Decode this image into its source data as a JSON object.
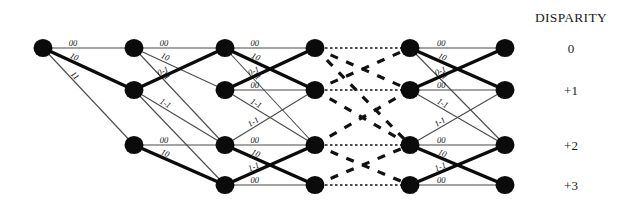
{
  "figure": {
    "title_right": "DISPARITY",
    "background_color": "#ffffff",
    "node_color": "#0b0b0b",
    "edge_color": "#4a4a4a",
    "bold_edge_color": "#0b0b0b",
    "dashed_edge_color": "#111111",
    "width": 624,
    "height": 216
  },
  "disparity_axis": {
    "title": "DISPARITY",
    "labels": [
      {
        "text": "0",
        "row": 0
      },
      {
        "text": "+1",
        "row": 1
      },
      {
        "text": "+2",
        "row": 2
      },
      {
        "text": "+3",
        "row": 3
      }
    ]
  },
  "chart_data": {
    "type": "diagram",
    "columns": [
      {
        "index": 0,
        "x": 43,
        "rows": [
          0
        ]
      },
      {
        "index": 1,
        "x": 134,
        "rows": [
          0,
          1,
          2
        ]
      },
      {
        "index": 2,
        "x": 225,
        "rows": [
          0,
          1,
          2,
          3
        ]
      },
      {
        "index": 3,
        "x": 315,
        "rows": [
          0,
          1,
          2,
          3
        ]
      },
      {
        "index": 4,
        "x": 410,
        "rows": [
          0,
          1,
          2,
          3
        ]
      },
      {
        "index": 5,
        "x": 505,
        "rows": [
          0,
          1,
          2,
          3
        ]
      }
    ],
    "row_y": [
      48,
      90,
      145,
      185
    ],
    "node_radius": 9.5,
    "edges": [
      {
        "from": [
          0,
          0
        ],
        "to": [
          1,
          0
        ],
        "style": "thin",
        "label": "00"
      },
      {
        "from": [
          0,
          0
        ],
        "to": [
          1,
          1
        ],
        "style": "bold",
        "label": "10"
      },
      {
        "from": [
          0,
          0
        ],
        "to": [
          1,
          2
        ],
        "style": "thin",
        "label": "11"
      },
      {
        "from": [
          1,
          0
        ],
        "to": [
          2,
          0
        ],
        "style": "thin",
        "label": "00"
      },
      {
        "from": [
          1,
          0
        ],
        "to": [
          2,
          1
        ],
        "style": "thin",
        "label": "10"
      },
      {
        "from": [
          1,
          0
        ],
        "to": [
          2,
          2
        ],
        "style": "thin",
        "label": "11"
      },
      {
        "from": [
          1,
          1
        ],
        "to": [
          2,
          0
        ],
        "style": "bold",
        "label": "0-1"
      },
      {
        "from": [
          1,
          1
        ],
        "to": [
          2,
          2
        ],
        "style": "thin",
        "label": "1-1"
      },
      {
        "from": [
          1,
          1
        ],
        "to": [
          2,
          3
        ],
        "style": "thin",
        "label": ""
      },
      {
        "from": [
          1,
          2
        ],
        "to": [
          2,
          2
        ],
        "style": "thin",
        "label": "00"
      },
      {
        "from": [
          1,
          2
        ],
        "to": [
          2,
          3
        ],
        "style": "bold",
        "label": "10"
      },
      {
        "from": [
          2,
          0
        ],
        "to": [
          3,
          0
        ],
        "style": "thin",
        "label": "00"
      },
      {
        "from": [
          2,
          0
        ],
        "to": [
          3,
          1
        ],
        "style": "bold",
        "label": "10"
      },
      {
        "from": [
          2,
          0
        ],
        "to": [
          3,
          2
        ],
        "style": "thin",
        "label": "11"
      },
      {
        "from": [
          2,
          1
        ],
        "to": [
          3,
          0
        ],
        "style": "bold",
        "label": "0-1"
      },
      {
        "from": [
          2,
          1
        ],
        "to": [
          3,
          1
        ],
        "style": "thin",
        "label": "00"
      },
      {
        "from": [
          2,
          1
        ],
        "to": [
          3,
          2
        ],
        "style": "thin",
        "label": "1-1"
      },
      {
        "from": [
          2,
          2
        ],
        "to": [
          3,
          1
        ],
        "style": "thin",
        "label": "1-1"
      },
      {
        "from": [
          2,
          2
        ],
        "to": [
          3,
          2
        ],
        "style": "thin",
        "label": "00"
      },
      {
        "from": [
          2,
          2
        ],
        "to": [
          3,
          3
        ],
        "style": "bold",
        "label": "10"
      },
      {
        "from": [
          2,
          3
        ],
        "to": [
          3,
          2
        ],
        "style": "bold",
        "label": "1-1"
      },
      {
        "from": [
          2,
          3
        ],
        "to": [
          3,
          3
        ],
        "style": "thin",
        "label": "00"
      },
      {
        "from": [
          3,
          0
        ],
        "to": [
          4,
          0
        ],
        "style": "dotted",
        "label": ""
      },
      {
        "from": [
          3,
          0
        ],
        "to": [
          4,
          1
        ],
        "style": "dashed",
        "label": ""
      },
      {
        "from": [
          3,
          0
        ],
        "to": [
          4,
          2
        ],
        "style": "dashed",
        "label": ""
      },
      {
        "from": [
          3,
          1
        ],
        "to": [
          4,
          0
        ],
        "style": "dashed",
        "label": ""
      },
      {
        "from": [
          3,
          1
        ],
        "to": [
          4,
          1
        ],
        "style": "dotted",
        "label": ""
      },
      {
        "from": [
          3,
          1
        ],
        "to": [
          4,
          2
        ],
        "style": "dashed",
        "label": ""
      },
      {
        "from": [
          3,
          2
        ],
        "to": [
          4,
          1
        ],
        "style": "dashed",
        "label": ""
      },
      {
        "from": [
          3,
          2
        ],
        "to": [
          4,
          2
        ],
        "style": "dotted",
        "label": ""
      },
      {
        "from": [
          3,
          2
        ],
        "to": [
          4,
          3
        ],
        "style": "dashed",
        "label": ""
      },
      {
        "from": [
          3,
          3
        ],
        "to": [
          4,
          2
        ],
        "style": "dashed",
        "label": ""
      },
      {
        "from": [
          3,
          3
        ],
        "to": [
          4,
          3
        ],
        "style": "dotted",
        "label": ""
      },
      {
        "from": [
          4,
          0
        ],
        "to": [
          5,
          0
        ],
        "style": "thin",
        "label": "00"
      },
      {
        "from": [
          4,
          0
        ],
        "to": [
          5,
          1
        ],
        "style": "bold",
        "label": "10"
      },
      {
        "from": [
          4,
          0
        ],
        "to": [
          5,
          2
        ],
        "style": "thin",
        "label": "11"
      },
      {
        "from": [
          4,
          1
        ],
        "to": [
          5,
          0
        ],
        "style": "bold",
        "label": "0-1"
      },
      {
        "from": [
          4,
          1
        ],
        "to": [
          5,
          1
        ],
        "style": "thin",
        "label": "00"
      },
      {
        "from": [
          4,
          1
        ],
        "to": [
          5,
          2
        ],
        "style": "thin",
        "label": "1-1"
      },
      {
        "from": [
          4,
          2
        ],
        "to": [
          5,
          1
        ],
        "style": "thin",
        "label": "1-1"
      },
      {
        "from": [
          4,
          2
        ],
        "to": [
          5,
          2
        ],
        "style": "thin",
        "label": "00"
      },
      {
        "from": [
          4,
          2
        ],
        "to": [
          5,
          3
        ],
        "style": "bold",
        "label": "10"
      },
      {
        "from": [
          4,
          3
        ],
        "to": [
          5,
          2
        ],
        "style": "bold",
        "label": "1-1"
      },
      {
        "from": [
          4,
          3
        ],
        "to": [
          5,
          3
        ],
        "style": "thin",
        "label": "00"
      }
    ],
    "edge_label_values": [
      "00",
      "10",
      "11",
      "0-1",
      "1-1"
    ],
    "legend_position": "right",
    "grid": false
  }
}
